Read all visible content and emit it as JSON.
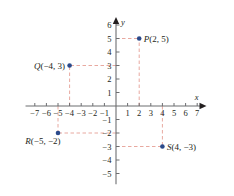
{
  "chart_data": {
    "type": "scatter",
    "title": "",
    "xlabel": "x",
    "ylabel": "y",
    "xlim": [
      -7.8,
      7.8
    ],
    "ylim": [
      -5.8,
      6.6
    ],
    "grid": false,
    "legend": "none",
    "x_ticks": [
      -7,
      -6,
      -5,
      -4,
      -3,
      -2,
      -1,
      1,
      2,
      3,
      4,
      5,
      6,
      7
    ],
    "y_ticks": [
      -5,
      -4,
      -3,
      -2,
      -1,
      1,
      2,
      3,
      4,
      5,
      6
    ],
    "x_tick_labels": [
      "−7",
      "−6",
      "−5",
      "−4",
      "−3",
      "−2",
      "−1",
      "1",
      "2",
      "3",
      "4",
      "5",
      "6",
      "7"
    ],
    "y_tick_labels": [
      "−5",
      "−4",
      "−3",
      "−2",
      "−1",
      "1",
      "2",
      "3",
      "4",
      "5",
      "6"
    ],
    "points": [
      {
        "name": "P",
        "x": 2,
        "y": 5,
        "label": "P(2, 5)",
        "label_side": "right"
      },
      {
        "name": "Q",
        "x": -4,
        "y": 3,
        "label": "Q(−4, 3)",
        "label_side": "left"
      },
      {
        "name": "R",
        "x": -5,
        "y": -2,
        "label": "R(−5, −2)",
        "label_side": "below-left"
      },
      {
        "name": "S",
        "x": 4,
        "y": -3,
        "label": "S(4, −3)",
        "label_side": "right"
      }
    ],
    "point_color": "#2b4a8b",
    "guide_color": "#e8a9a0",
    "axis_color": "#6d6e71",
    "text_color": "#231f20",
    "guide_style": "dashed"
  },
  "axes": {
    "x_axis_label": "x",
    "y_axis_label": "y"
  }
}
